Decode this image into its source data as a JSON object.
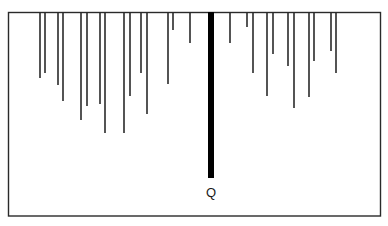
{
  "diagram": {
    "label": "Q",
    "colors": {
      "background": "#ffffff",
      "frame": "#2a2a2a",
      "line": "#2a2a2a",
      "highlight_line": "#000000"
    },
    "thin_line_count": 27,
    "highlight_line_count": 1
  }
}
